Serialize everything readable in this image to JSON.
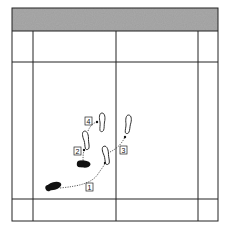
{
  "diagram": {
    "colors": {
      "header_fill": "#a9a9a9",
      "line": "#222222",
      "footprint_solid": "#111111",
      "footprint_outline": "#222222",
      "background": "#ffffff"
    },
    "court": {
      "outer": {
        "x": 12,
        "y": 8,
        "w": 206,
        "h": 213
      },
      "header_bottom": 31,
      "vertical_lines_x": [
        33,
        116,
        198
      ],
      "horizontal_lines_y": [
        62,
        199
      ]
    },
    "steps": [
      {
        "number": "1",
        "label_x": 88,
        "label_y": 188
      },
      {
        "number": "2",
        "label_x": 77,
        "label_y": 151
      },
      {
        "number": "3",
        "label_x": 121,
        "label_y": 149
      },
      {
        "number": "4",
        "label_x": 87,
        "label_y": 120
      }
    ],
    "footprints": [
      {
        "id": "start-left",
        "style": "solid",
        "cx": 54,
        "cy": 186
      },
      {
        "id": "start-right",
        "style": "solid",
        "cx": 84,
        "cy": 164
      },
      {
        "id": "step-2-foot",
        "style": "outline",
        "cx": 86,
        "cy": 140
      },
      {
        "id": "step-3-foot",
        "style": "outline",
        "cx": 106,
        "cy": 155
      },
      {
        "id": "step-4-foot",
        "style": "outline",
        "cx": 102,
        "cy": 122
      },
      {
        "id": "step-3-target",
        "style": "outline",
        "cx": 128,
        "cy": 124
      }
    ]
  }
}
